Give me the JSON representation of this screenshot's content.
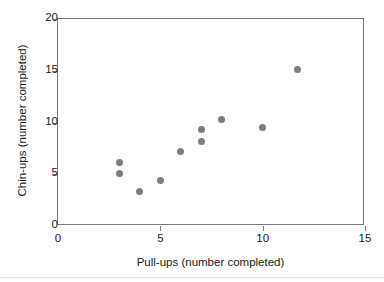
{
  "chart_data": {
    "type": "scatter",
    "title": "",
    "xlabel": "Pull-ups (number completed)",
    "ylabel": "Chin-ups (number completed)",
    "xlim": [
      0,
      15
    ],
    "ylim": [
      0,
      20
    ],
    "xticks": [
      0,
      5,
      10,
      15
    ],
    "yticks": [
      0,
      5,
      10,
      15,
      20
    ],
    "xtick_labels": [
      "0",
      "5",
      "10",
      "15"
    ],
    "ytick_labels": [
      "0",
      "5",
      "10",
      "15",
      "20"
    ],
    "grid": false,
    "legend": null,
    "marker_color": "#7d7d7d",
    "marker_shape": "circle",
    "axis_color": "#7a7a7a",
    "background": "#ffffff",
    "series": [
      {
        "name": "Pull-ups vs Chin-ups",
        "points": [
          {
            "x": 3.0,
            "y": 6.1
          },
          {
            "x": 3.0,
            "y": 5.1
          },
          {
            "x": 4.0,
            "y": 3.3
          },
          {
            "x": 5.0,
            "y": 4.4
          },
          {
            "x": 6.0,
            "y": 7.2
          },
          {
            "x": 7.0,
            "y": 9.3
          },
          {
            "x": 7.0,
            "y": 8.2
          },
          {
            "x": 8.0,
            "y": 10.3
          },
          {
            "x": 10.0,
            "y": 9.5
          },
          {
            "x": 11.7,
            "y": 15.1
          }
        ]
      }
    ]
  }
}
